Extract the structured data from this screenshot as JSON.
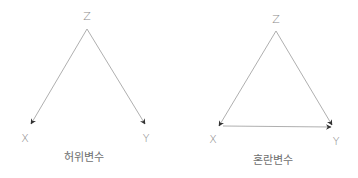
{
  "diagrams": [
    {
      "caption": "허위변수",
      "nodes": {
        "z": "Z",
        "x": "X",
        "y": "Y"
      },
      "edges": [
        "Z→X",
        "Z→Y"
      ]
    },
    {
      "caption": "혼란변수",
      "nodes": {
        "z": "Z",
        "x": "X",
        "y": "Y"
      },
      "edges": [
        "Z→X",
        "Z→Y",
        "X→Y"
      ]
    }
  ],
  "colors": {
    "line": "#9a9a9a",
    "arrowhead": "#333333",
    "text": "#8a8a8a"
  }
}
